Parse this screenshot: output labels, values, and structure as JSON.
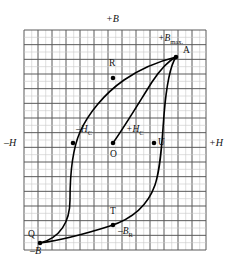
{
  "figure": {
    "type": "hysteresis-loop"
  },
  "colors": {
    "grid_line": "#5a5a5a",
    "grid_line_light": "#c9c9c9",
    "curve": "#000000",
    "background": "#ffffff",
    "text": "#111111"
  },
  "grid": {
    "columns": 13,
    "rows": 15,
    "cell_width": 14,
    "cell_height": 14.7,
    "left": 24,
    "top": 30,
    "right": 206,
    "bottom": 250
  },
  "axes": {
    "top_label": "+B",
    "left_label": "–H",
    "right_label": "+H",
    "bottom_label": "–B"
  },
  "points": [
    {
      "id": "A",
      "label": "A",
      "x": 176,
      "y": 57,
      "dot": true,
      "label_dx": 7,
      "label_dy": -6
    },
    {
      "id": "Bmax",
      "label": "+B<sub>max.</sub>",
      "x": 176,
      "y": 57,
      "dot": false,
      "label_dx": -18,
      "label_dy": -18,
      "italic": true
    },
    {
      "id": "R",
      "label": "R",
      "x": 113,
      "y": 78,
      "dot": true,
      "label_dx": -4,
      "label_dy": -14
    },
    {
      "id": "mHc",
      "label": "–H<sub>C</sub>",
      "x": 73,
      "y": 143,
      "dot": true,
      "label_dx": 3,
      "label_dy": -13,
      "italic": true
    },
    {
      "id": "O",
      "label": "O",
      "x": 113,
      "y": 143,
      "dot": true,
      "label_dx": -3,
      "label_dy": 12
    },
    {
      "id": "pHc",
      "label": "+H<sub>C</sub>",
      "x": 154,
      "y": 143,
      "dot": false,
      "label_dx": -28,
      "label_dy": -13,
      "italic": true
    },
    {
      "id": "U",
      "label": "U",
      "x": 154,
      "y": 143,
      "dot": true,
      "label_dx": 4,
      "label_dy": 0
    },
    {
      "id": "T",
      "label": "T",
      "x": 113,
      "y": 225,
      "dot": true,
      "label_dx": -3,
      "label_dy": -13
    },
    {
      "id": "mBr",
      "label": "–B<sub>R</sub>",
      "x": 113,
      "y": 225,
      "dot": false,
      "label_dx": 5,
      "label_dy": 7,
      "italic": true
    },
    {
      "id": "Q",
      "label": "Q",
      "x": 40,
      "y": 243,
      "dot": true,
      "label_dx": -12,
      "label_dy": -8
    }
  ],
  "curves": {
    "initial_magnetization": "M 113,143 C 125,126 140,101 152,82 C 162,67 170,60 176,57",
    "upper_branch": "M 176,57 C 160,61 140,69 124,80 C 104,94 88,114 80,132 C 73,148 70,175 70,200 C 70,222 60,238 40,243",
    "lower_branch": "M 40,243 C 62,240 88,233 110,226 C 132,219 148,205 155,185 C 161,167 162,140 164,115 C 166,90 170,66 176,57"
  },
  "labels_meta": {
    "axis_font_size_px": 10,
    "point_font_size_px": 9.5
  }
}
